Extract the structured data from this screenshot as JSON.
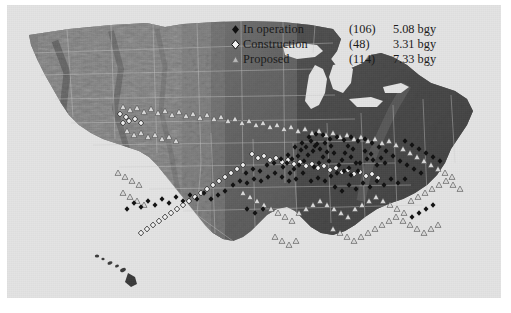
{
  "figure": {
    "kind": "thematic-map",
    "background_color": "#ffffff",
    "panel_color": "#e3e3e3",
    "map_style": "grayscale shaded relief"
  },
  "legend": {
    "rows": [
      {
        "marker": "filled-diamond-icon",
        "label": "In operation",
        "count": "(106)",
        "value": "5.08 bgy"
      },
      {
        "marker": "open-diamond-icon",
        "label": "Construction",
        "count": "(48)",
        "value": "3.31 bgy"
      },
      {
        "marker": "triangle-icon",
        "label": "Proposed",
        "count": "(114)",
        "value": "7.33 bgy"
      }
    ]
  },
  "chart_data": {
    "type": "map",
    "title": "",
    "legend_position": "top-center-right",
    "categories": [
      "In operation",
      "Construction",
      "Proposed"
    ],
    "counts": [
      106,
      48,
      114
    ],
    "capacity_bgy": [
      5.08,
      3.31,
      7.33
    ],
    "capacity_units": "bgy",
    "series": [
      {
        "name": "In operation",
        "marker": "filled-diamond",
        "count": 106,
        "capacity_bgy": 5.08
      },
      {
        "name": "Construction",
        "marker": "open-diamond",
        "count": 48,
        "capacity_bgy": 3.31
      },
      {
        "name": "Proposed",
        "marker": "triangle",
        "count": 114,
        "capacity_bgy": 7.33
      }
    ],
    "region": "United States (contiguous, with Hawaii inset)"
  },
  "markers": {
    "operation": [
      [
        350,
        138
      ],
      [
        356,
        141
      ],
      [
        352,
        146
      ],
      [
        358,
        147
      ],
      [
        345,
        150
      ],
      [
        362,
        152
      ],
      [
        366,
        145
      ],
      [
        370,
        150
      ],
      [
        333,
        133
      ],
      [
        338,
        136
      ],
      [
        330,
        140
      ],
      [
        336,
        144
      ],
      [
        327,
        147
      ],
      [
        341,
        150
      ],
      [
        324,
        152
      ],
      [
        334,
        155
      ],
      [
        310,
        130
      ],
      [
        316,
        133
      ],
      [
        305,
        136
      ],
      [
        312,
        139
      ],
      [
        300,
        133
      ],
      [
        319,
        140
      ],
      [
        308,
        144
      ],
      [
        314,
        148
      ],
      [
        296,
        128
      ],
      [
        302,
        131
      ],
      [
        291,
        134
      ],
      [
        298,
        138
      ],
      [
        286,
        137
      ],
      [
        293,
        142
      ],
      [
        304,
        150
      ],
      [
        299,
        154
      ],
      [
        283,
        143
      ],
      [
        289,
        148
      ],
      [
        277,
        146
      ],
      [
        284,
        152
      ],
      [
        272,
        150
      ],
      [
        279,
        156
      ],
      [
        268,
        154
      ],
      [
        275,
        160
      ],
      [
        322,
        160
      ],
      [
        329,
        158
      ],
      [
        316,
        163
      ],
      [
        336,
        162
      ],
      [
        343,
        158
      ],
      [
        310,
        168
      ],
      [
        303,
        165
      ],
      [
        296,
        168
      ],
      [
        288,
        160
      ],
      [
        281,
        166
      ],
      [
        274,
        168
      ],
      [
        267,
        164
      ],
      [
        260,
        160
      ],
      [
        253,
        164
      ],
      [
        246,
        168
      ],
      [
        239,
        166
      ],
      [
        232,
        170
      ],
      [
        225,
        168
      ],
      [
        218,
        172
      ],
      [
        245,
        158
      ],
      [
        238,
        156
      ],
      [
        231,
        160
      ],
      [
        252,
        152
      ],
      [
        259,
        150
      ],
      [
        266,
        146
      ],
      [
        273,
        142
      ],
      [
        280,
        134
      ],
      [
        287,
        130
      ],
      [
        294,
        124
      ],
      [
        301,
        121
      ],
      [
        308,
        122
      ],
      [
        315,
        126
      ],
      [
        322,
        124
      ],
      [
        329,
        127
      ],
      [
        336,
        124
      ],
      [
        343,
        128
      ],
      [
        350,
        126
      ],
      [
        357,
        130
      ],
      [
        364,
        134
      ],
      [
        371,
        138
      ],
      [
        378,
        143
      ],
      [
        385,
        148
      ],
      [
        392,
        152
      ],
      [
        399,
        156
      ],
      [
        406,
        160
      ],
      [
        390,
        166
      ],
      [
        383,
        170
      ],
      [
        376,
        166
      ],
      [
        369,
        172
      ],
      [
        362,
        168
      ],
      [
        355,
        174
      ],
      [
        348,
        170
      ],
      [
        341,
        176
      ],
      [
        334,
        172
      ],
      [
        327,
        178
      ],
      [
        320,
        174
      ],
      [
        232,
        196
      ],
      [
        240,
        200
      ],
      [
        248,
        196
      ],
      [
        210,
        178
      ],
      [
        203,
        182
      ],
      [
        196,
        186
      ],
      [
        189,
        180
      ],
      [
        182,
        186
      ],
      [
        175,
        182
      ],
      [
        168,
        188
      ],
      [
        161,
        184
      ],
      [
        154,
        190
      ],
      [
        147,
        186
      ],
      [
        140,
        192
      ],
      [
        133,
        188
      ],
      [
        126,
        194
      ],
      [
        119,
        190
      ],
      [
        112,
        196
      ],
      [
        390,
        128
      ],
      [
        397,
        132
      ],
      [
        404,
        136
      ],
      [
        411,
        140
      ],
      [
        418,
        144
      ],
      [
        425,
        148
      ],
      [
        418,
        192
      ],
      [
        411,
        196
      ],
      [
        404,
        200
      ],
      [
        397,
        204
      ]
    ],
    "construction": [
      [
        105,
        101
      ],
      [
        111,
        104
      ],
      [
        108,
        110
      ],
      [
        114,
        108
      ],
      [
        120,
        106
      ],
      [
        126,
        110
      ],
      [
        237,
        141
      ],
      [
        243,
        145
      ],
      [
        249,
        143
      ],
      [
        255,
        147
      ],
      [
        261,
        145
      ],
      [
        267,
        149
      ],
      [
        273,
        147
      ],
      [
        279,
        151
      ],
      [
        285,
        149
      ],
      [
        291,
        153
      ],
      [
        297,
        151
      ],
      [
        303,
        155
      ],
      [
        309,
        153
      ],
      [
        315,
        157
      ],
      [
        321,
        155
      ],
      [
        327,
        159
      ],
      [
        333,
        157
      ],
      [
        339,
        161
      ],
      [
        345,
        159
      ],
      [
        351,
        163
      ],
      [
        357,
        161
      ],
      [
        363,
        165
      ],
      [
        228,
        152
      ],
      [
        222,
        156
      ],
      [
        216,
        160
      ],
      [
        210,
        164
      ],
      [
        204,
        168
      ],
      [
        198,
        172
      ],
      [
        192,
        176
      ],
      [
        186,
        180
      ],
      [
        180,
        184
      ],
      [
        174,
        188
      ],
      [
        168,
        192
      ],
      [
        162,
        196
      ],
      [
        156,
        200
      ],
      [
        150,
        204
      ],
      [
        144,
        208
      ],
      [
        138,
        212
      ],
      [
        132,
        216
      ],
      [
        126,
        220
      ]
    ],
    "proposed": [
      [
        108,
        94
      ],
      [
        115,
        97
      ],
      [
        122,
        95
      ],
      [
        129,
        99
      ],
      [
        136,
        96
      ],
      [
        143,
        100
      ],
      [
        150,
        98
      ],
      [
        157,
        102
      ],
      [
        164,
        99
      ],
      [
        171,
        103
      ],
      [
        178,
        101
      ],
      [
        185,
        105
      ],
      [
        192,
        102
      ],
      [
        199,
        106
      ],
      [
        206,
        104
      ],
      [
        213,
        108
      ],
      [
        220,
        106
      ],
      [
        227,
        110
      ],
      [
        234,
        108
      ],
      [
        241,
        112
      ],
      [
        248,
        110
      ],
      [
        255,
        114
      ],
      [
        262,
        112
      ],
      [
        269,
        116
      ],
      [
        276,
        114
      ],
      [
        283,
        118
      ],
      [
        290,
        116
      ],
      [
        297,
        120
      ],
      [
        304,
        118
      ],
      [
        311,
        122
      ],
      [
        318,
        120
      ],
      [
        325,
        124
      ],
      [
        332,
        122
      ],
      [
        339,
        126
      ],
      [
        346,
        124
      ],
      [
        353,
        128
      ],
      [
        360,
        126
      ],
      [
        367,
        130
      ],
      [
        374,
        128
      ],
      [
        381,
        132
      ],
      [
        388,
        136
      ],
      [
        395,
        140
      ],
      [
        402,
        144
      ],
      [
        409,
        148
      ],
      [
        416,
        152
      ],
      [
        423,
        156
      ],
      [
        430,
        160
      ],
      [
        437,
        164
      ],
      [
        112,
        118
      ],
      [
        119,
        122
      ],
      [
        126,
        120
      ],
      [
        133,
        124
      ],
      [
        140,
        122
      ],
      [
        147,
        126
      ],
      [
        154,
        124
      ],
      [
        161,
        128
      ],
      [
        103,
        160
      ],
      [
        110,
        164
      ],
      [
        117,
        168
      ],
      [
        124,
        172
      ],
      [
        108,
        180
      ],
      [
        115,
        184
      ],
      [
        122,
        188
      ],
      [
        129,
        192
      ],
      [
        228,
        180
      ],
      [
        235,
        184
      ],
      [
        242,
        188
      ],
      [
        249,
        192
      ],
      [
        256,
        196
      ],
      [
        263,
        200
      ],
      [
        270,
        204
      ],
      [
        277,
        208
      ],
      [
        284,
        200
      ],
      [
        291,
        196
      ],
      [
        298,
        192
      ],
      [
        305,
        188
      ],
      [
        312,
        192
      ],
      [
        319,
        196
      ],
      [
        326,
        200
      ],
      [
        333,
        204
      ],
      [
        340,
        196
      ],
      [
        347,
        192
      ],
      [
        354,
        188
      ],
      [
        361,
        184
      ],
      [
        368,
        188
      ],
      [
        375,
        192
      ],
      [
        382,
        196
      ],
      [
        389,
        200
      ],
      [
        396,
        188
      ],
      [
        403,
        184
      ],
      [
        410,
        180
      ],
      [
        417,
        176
      ],
      [
        424,
        172
      ],
      [
        431,
        168
      ],
      [
        438,
        172
      ],
      [
        445,
        176
      ],
      [
        318,
        216
      ],
      [
        325,
        220
      ],
      [
        332,
        224
      ],
      [
        339,
        228
      ],
      [
        346,
        224
      ],
      [
        353,
        220
      ],
      [
        360,
        216
      ],
      [
        367,
        212
      ],
      [
        374,
        208
      ],
      [
        381,
        204
      ],
      [
        388,
        208
      ],
      [
        395,
        212
      ],
      [
        402,
        216
      ],
      [
        409,
        220
      ],
      [
        416,
        216
      ],
      [
        423,
        212
      ],
      [
        260,
        224
      ],
      [
        267,
        228
      ],
      [
        274,
        232
      ],
      [
        281,
        228
      ]
    ]
  }
}
